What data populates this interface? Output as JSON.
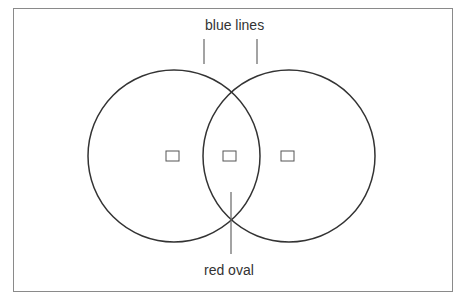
{
  "diagram": {
    "labels": {
      "top": "blue lines",
      "bottom": "red oval"
    },
    "circles": [
      {
        "name": "left-circle",
        "cx": 174,
        "cy": 156,
        "r": 86
      },
      {
        "name": "right-circle",
        "cx": 289,
        "cy": 156,
        "r": 86
      }
    ],
    "markers": [
      {
        "name": "left-marker",
        "x": 166,
        "y": 151
      },
      {
        "name": "center-marker",
        "x": 223,
        "y": 151
      },
      {
        "name": "right-marker",
        "x": 281,
        "y": 151
      }
    ],
    "colors": {
      "stroke": "#333333",
      "frame": "#8a8a8a",
      "leader": "#666666"
    }
  }
}
